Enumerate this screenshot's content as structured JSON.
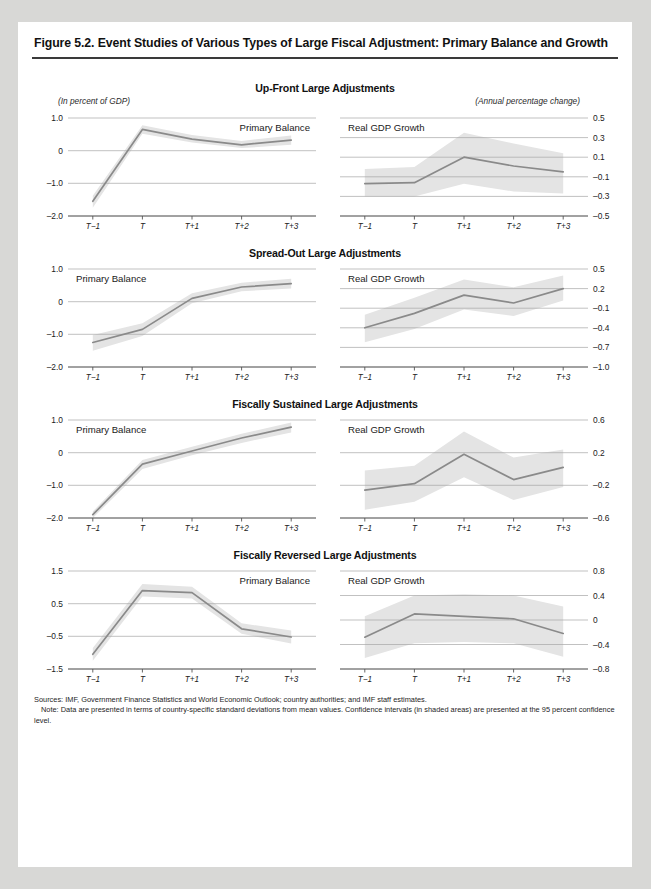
{
  "figure": {
    "title": "Figure 5.2. Event Studies of Various Types of Large Fiscal Adjustment: Primary Balance and Growth",
    "units_left": "(In percent of GDP)",
    "units_right": "(Annual percentage change)",
    "sources": "Sources: IMF, Government Finance Statistics and World Economic Outlook; country authorities; and IMF staff estimates.",
    "note": "Note: Data are presented in terms of country-specific standard deviations from mean values. Confidence intervals (in shaded areas) are presented at the 95 percent confidence level.",
    "line_color": "#8a8a8a",
    "band_color": "#e4e4e4",
    "grid_color": "#a6a6a6",
    "axis_color": "#555555"
  },
  "panels": [
    {
      "heading": "Up-Front Large Adjustments"
    },
    {
      "heading": "Spread-Out Large Adjustments"
    },
    {
      "heading": "Fiscally Sustained Large Adjustments"
    },
    {
      "heading": "Fiscally Reversed Large Adjustments"
    }
  ],
  "chart_data": [
    {
      "type": "line",
      "title": "Up-Front Large Adjustments",
      "panel": "left",
      "series_label": "Primary Balance",
      "ylabel": "(In percent of GDP)",
      "xlabel": "",
      "x": [
        "T−1",
        "T",
        "T+1",
        "T+2",
        "T+3"
      ],
      "ylim": [
        -2.0,
        1.0
      ],
      "yticks": [
        1.0,
        0,
        -1.0,
        -2.0
      ],
      "ytick_labels": [
        "1.0",
        "0",
        "–1.0",
        "–2.0"
      ],
      "grid": true,
      "values": [
        -1.55,
        0.65,
        0.35,
        0.18,
        0.32
      ],
      "band_lower": [
        -1.75,
        0.52,
        0.25,
        0.08,
        0.18
      ],
      "band_upper": [
        -1.38,
        0.78,
        0.48,
        0.3,
        0.46
      ]
    },
    {
      "type": "line",
      "title": "Up-Front Large Adjustments",
      "panel": "right",
      "series_label": "Real GDP Growth",
      "ylabel": "(Annual percentage change)",
      "xlabel": "",
      "x": [
        "T−1",
        "T",
        "T+1",
        "T+2",
        "T+3"
      ],
      "ylim": [
        -0.5,
        0.5
      ],
      "yticks": [
        0.5,
        0.3,
        0.1,
        -0.1,
        -0.3,
        -0.5
      ],
      "ytick_labels": [
        "0.5",
        "0.3",
        "0.1",
        "–0.1",
        "–0.3",
        "–0.5"
      ],
      "grid": true,
      "values": [
        -0.17,
        -0.16,
        0.1,
        0.01,
        -0.05
      ],
      "band_lower": [
        -0.3,
        -0.3,
        -0.17,
        -0.25,
        -0.27
      ],
      "band_upper": [
        -0.02,
        0.0,
        0.35,
        0.24,
        0.14
      ]
    },
    {
      "type": "line",
      "title": "Spread-Out Large Adjustments",
      "panel": "left",
      "series_label": "Primary Balance",
      "ylabel": "(In percent of GDP)",
      "xlabel": "",
      "x": [
        "T−1",
        "T",
        "T+1",
        "T+2",
        "T+3"
      ],
      "ylim": [
        -2.0,
        1.0
      ],
      "yticks": [
        1.0,
        0,
        -1.0,
        -2.0
      ],
      "ytick_labels": [
        "1.0",
        "0",
        "–1.0",
        "–2.0"
      ],
      "grid": true,
      "values": [
        -1.25,
        -0.85,
        0.1,
        0.45,
        0.55
      ],
      "band_lower": [
        -1.5,
        -1.05,
        -0.05,
        0.32,
        0.4
      ],
      "band_upper": [
        -1.02,
        -0.66,
        0.26,
        0.58,
        0.7
      ]
    },
    {
      "type": "line",
      "title": "Spread-Out Large Adjustments",
      "panel": "right",
      "series_label": "Real GDP Growth",
      "ylabel": "(Annual percentage change)",
      "xlabel": "",
      "x": [
        "T−1",
        "T",
        "T+1",
        "T+2",
        "T+3"
      ],
      "ylim": [
        -1.0,
        0.5
      ],
      "yticks": [
        0.5,
        0.2,
        -0.1,
        -0.4,
        -0.7,
        -1.0
      ],
      "ytick_labels": [
        "0.5",
        "0.2",
        "–0.1",
        "–0.4",
        "–0.7",
        "–1.0"
      ],
      "grid": true,
      "values": [
        -0.4,
        -0.18,
        0.1,
        -0.02,
        0.2
      ],
      "band_lower": [
        -0.62,
        -0.42,
        -0.12,
        -0.22,
        0.02
      ],
      "band_upper": [
        -0.2,
        0.06,
        0.34,
        0.22,
        0.4
      ]
    },
    {
      "type": "line",
      "title": "Fiscally Sustained Large Adjustments",
      "panel": "left",
      "series_label": "Primary Balance",
      "ylabel": "(In percent of GDP)",
      "xlabel": "",
      "x": [
        "T−1",
        "T",
        "T+1",
        "T+2",
        "T+3"
      ],
      "ylim": [
        -2.0,
        1.0
      ],
      "yticks": [
        1.0,
        0,
        -1.0,
        -2.0
      ],
      "ytick_labels": [
        "1.0",
        "0",
        "–1.0",
        "–2.0"
      ],
      "grid": true,
      "values": [
        -1.9,
        -0.35,
        0.05,
        0.45,
        0.78
      ],
      "band_lower": [
        -2.0,
        -0.5,
        -0.08,
        0.3,
        0.62
      ],
      "band_upper": [
        -1.8,
        -0.22,
        0.18,
        0.58,
        0.92
      ]
    },
    {
      "type": "line",
      "title": "Fiscally Sustained Large Adjustments",
      "panel": "right",
      "series_label": "Real GDP Growth",
      "ylabel": "(Annual percentage change)",
      "xlabel": "",
      "x": [
        "T−1",
        "T",
        "T+1",
        "T+2",
        "T+3"
      ],
      "ylim": [
        -0.6,
        0.6
      ],
      "yticks": [
        0.6,
        0.2,
        -0.2,
        -0.6
      ],
      "ytick_labels": [
        "0.6",
        "0.2",
        "–0.2",
        "–0.6"
      ],
      "grid": true,
      "values": [
        -0.26,
        -0.18,
        0.18,
        -0.13,
        0.02
      ],
      "band_lower": [
        -0.5,
        -0.4,
        -0.1,
        -0.38,
        -0.22
      ],
      "band_upper": [
        -0.02,
        0.04,
        0.46,
        0.14,
        0.24
      ]
    },
    {
      "type": "line",
      "title": "Fiscally Reversed Large Adjustments",
      "panel": "left",
      "series_label": "Primary Balance",
      "ylabel": "(In percent of GDP)",
      "xlabel": "",
      "x": [
        "T−1",
        "T",
        "T+1",
        "T+2",
        "T+3"
      ],
      "ylim": [
        -1.5,
        1.5
      ],
      "yticks": [
        1.5,
        0.5,
        -0.5,
        -1.5
      ],
      "ytick_labels": [
        "1.5",
        "0.5",
        "–0.5",
        "–1.5"
      ],
      "grid": true,
      "values": [
        -1.05,
        0.9,
        0.84,
        -0.27,
        -0.52
      ],
      "band_lower": [
        -1.25,
        0.72,
        0.66,
        -0.42,
        -0.72
      ],
      "band_upper": [
        -0.86,
        1.1,
        1.02,
        -0.1,
        -0.32
      ]
    },
    {
      "type": "line",
      "title": "Fiscally Reversed Large Adjustments",
      "panel": "right",
      "series_label": "Real GDP Growth",
      "ylabel": "(Annual percentage change)",
      "xlabel": "",
      "x": [
        "T−1",
        "T",
        "T+1",
        "T+2",
        "T+3"
      ],
      "ylim": [
        -0.8,
        0.8
      ],
      "yticks": [
        0.8,
        0.4,
        0,
        -0.4,
        -0.8
      ],
      "ytick_labels": [
        "0.8",
        "0.4",
        "0",
        "–0.4",
        "–0.8"
      ],
      "grid": true,
      "values": [
        -0.28,
        0.1,
        0.06,
        0.02,
        -0.22
      ],
      "band_lower": [
        -0.62,
        -0.38,
        -0.36,
        -0.38,
        -0.6
      ],
      "band_upper": [
        0.06,
        0.4,
        0.42,
        0.4,
        0.22
      ]
    }
  ]
}
